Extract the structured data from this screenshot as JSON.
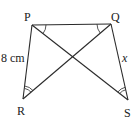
{
  "diagram": {
    "type": "geometry",
    "points": {
      "P": "P",
      "Q": "Q",
      "R": "R",
      "S": "S"
    },
    "segments": [
      "PQ",
      "PR",
      "QS",
      "PS",
      "QR"
    ],
    "side_labels": {
      "PR": "8 cm",
      "QS": "x"
    },
    "angle_marks": {
      "single_arc": [
        "QPS",
        "PQR"
      ],
      "double_arc": [
        "PRQ",
        "QSP"
      ]
    }
  }
}
